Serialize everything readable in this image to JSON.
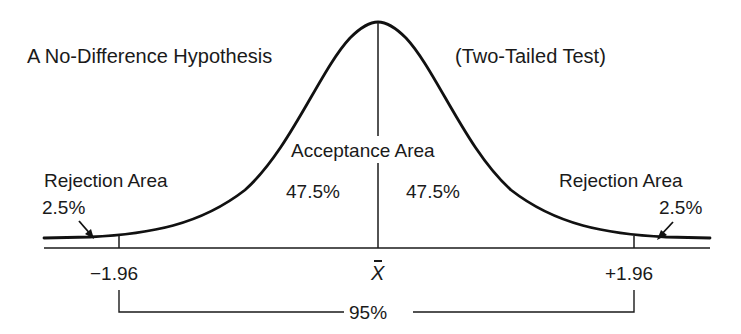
{
  "title_left": "A No-Difference Hypothesis",
  "title_right": "(Two-Tailed Test)",
  "acceptance": {
    "label": "Acceptance Area",
    "left_pct": "47.5%",
    "right_pct": "47.5%"
  },
  "rejection_left": {
    "label": "Rejection Area",
    "pct": "2.5%"
  },
  "rejection_right": {
    "label": "Rejection Area",
    "pct": "2.5%"
  },
  "axis": {
    "left_tick": "−1.96",
    "center": "X",
    "right_tick": "+1.96"
  },
  "bracket": {
    "label": "95%"
  },
  "colors": {
    "ink": "#1a1a1a",
    "background": "#ffffff"
  }
}
